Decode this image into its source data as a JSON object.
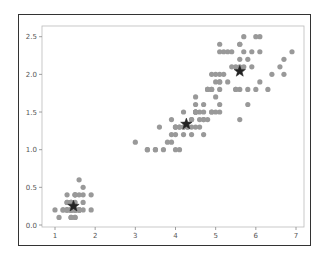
{
  "chart_data": {
    "type": "scatter",
    "title": "",
    "xlabel": "",
    "ylabel": "",
    "xlim": [
      0.75,
      7.2
    ],
    "ylim": [
      -0.02,
      2.62
    ],
    "grid": false,
    "legend": null,
    "x_ticks": [
      1,
      2,
      3,
      4,
      5,
      6,
      7
    ],
    "x_tick_labels": [
      "1",
      "2",
      "3",
      "4",
      "5",
      "6",
      "7"
    ],
    "y_ticks": [
      0.0,
      0.5,
      1.0,
      1.5,
      2.0,
      2.5
    ],
    "y_tick_labels": [
      "0.0",
      "0.5",
      "1.0",
      "1.5",
      "2.0",
      "2.5"
    ],
    "point_color": "#999999",
    "centroid_color": "#222222",
    "series": [
      {
        "name": "points",
        "marker": "circle",
        "x": [
          1.4,
          1.4,
          1.3,
          1.5,
          1.4,
          1.7,
          1.4,
          1.5,
          1.4,
          1.5,
          1.5,
          1.6,
          1.4,
          1.1,
          1.2,
          1.5,
          1.3,
          1.4,
          1.7,
          1.5,
          1.7,
          1.5,
          1.0,
          1.7,
          1.9,
          1.6,
          1.6,
          1.5,
          1.4,
          1.6,
          1.6,
          1.5,
          1.5,
          1.4,
          1.5,
          1.2,
          1.3,
          1.4,
          1.3,
          1.5,
          1.3,
          1.3,
          1.3,
          1.6,
          1.9,
          1.4,
          1.6,
          1.4,
          1.5,
          1.4,
          4.7,
          4.5,
          4.9,
          4.0,
          4.6,
          4.5,
          4.7,
          3.3,
          4.6,
          3.9,
          3.5,
          4.2,
          4.0,
          4.7,
          3.6,
          4.4,
          4.5,
          4.1,
          4.5,
          3.9,
          4.8,
          4.0,
          4.9,
          4.7,
          4.3,
          4.4,
          4.8,
          5.0,
          4.5,
          3.5,
          3.8,
          3.7,
          3.9,
          5.1,
          4.5,
          4.5,
          4.7,
          4.4,
          4.1,
          4.0,
          4.4,
          4.6,
          4.0,
          3.3,
          4.2,
          4.2,
          4.2,
          4.3,
          3.0,
          4.1,
          6.0,
          5.1,
          5.9,
          5.6,
          5.8,
          6.6,
          4.5,
          6.3,
          5.8,
          6.1,
          5.1,
          5.3,
          5.5,
          5.0,
          5.1,
          5.3,
          5.5,
          6.7,
          6.9,
          5.0,
          5.7,
          4.9,
          6.7,
          4.9,
          5.7,
          6.0,
          4.8,
          4.9,
          5.6,
          5.8,
          6.1,
          6.4,
          5.6,
          5.1,
          5.6,
          6.1,
          5.6,
          5.5,
          4.8,
          5.4,
          5.6,
          5.1,
          5.1,
          5.9,
          5.7,
          5.2,
          5.0,
          5.2,
          5.4,
          5.1
        ],
        "y": [
          0.2,
          0.2,
          0.2,
          0.2,
          0.2,
          0.4,
          0.3,
          0.2,
          0.2,
          0.1,
          0.2,
          0.2,
          0.1,
          0.1,
          0.2,
          0.4,
          0.4,
          0.3,
          0.3,
          0.3,
          0.2,
          0.4,
          0.2,
          0.5,
          0.2,
          0.2,
          0.4,
          0.2,
          0.2,
          0.2,
          0.2,
          0.4,
          0.1,
          0.2,
          0.2,
          0.2,
          0.2,
          0.1,
          0.2,
          0.2,
          0.3,
          0.3,
          0.2,
          0.6,
          0.4,
          0.3,
          0.2,
          0.2,
          0.2,
          0.2,
          1.4,
          1.5,
          1.5,
          1.3,
          1.5,
          1.3,
          1.6,
          1.0,
          1.3,
          1.4,
          1.0,
          1.5,
          1.0,
          1.4,
          1.3,
          1.4,
          1.5,
          1.0,
          1.5,
          1.1,
          1.8,
          1.3,
          1.5,
          1.2,
          1.3,
          1.4,
          1.4,
          1.7,
          1.5,
          1.0,
          1.1,
          1.0,
          1.2,
          1.6,
          1.5,
          1.6,
          1.5,
          1.3,
          1.3,
          1.3,
          1.2,
          1.4,
          1.2,
          1.0,
          1.3,
          1.2,
          1.3,
          1.3,
          1.1,
          1.3,
          2.5,
          1.9,
          2.1,
          1.8,
          2.2,
          2.1,
          1.7,
          1.8,
          1.8,
          2.5,
          2.0,
          1.9,
          2.1,
          2.0,
          2.4,
          2.3,
          1.8,
          2.2,
          2.3,
          1.5,
          2.3,
          2.0,
          2.0,
          1.8,
          2.1,
          1.8,
          1.8,
          1.8,
          2.1,
          1.6,
          1.9,
          2.0,
          2.2,
          1.5,
          1.4,
          2.3,
          2.4,
          1.8,
          1.8,
          2.1,
          2.4,
          2.3,
          1.9,
          2.3,
          2.5,
          2.3,
          1.9,
          2.0,
          2.3,
          1.8
        ]
      },
      {
        "name": "centroids",
        "marker": "star",
        "x": [
          1.46,
          4.27,
          5.6
        ],
        "y": [
          0.25,
          1.34,
          2.04
        ]
      }
    ]
  }
}
